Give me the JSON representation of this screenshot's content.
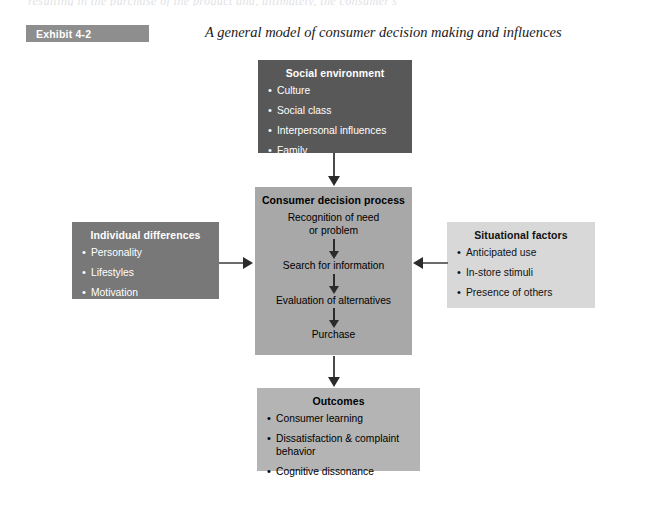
{
  "page": {
    "bleed_text": "resulting in the purchase of the product and, ultimately, the consumer's",
    "exhibit_label": "Exhibit 4-2",
    "exhibit_title": "A general model of consumer decision making and influences"
  },
  "colors": {
    "social_environment_bg": "#585858",
    "individual_differences_bg": "#787878",
    "situational_factors_bg": "#d8d8d8",
    "consumer_decision_process_bg": "#a8a8a8",
    "outcomes_bg": "#b4b4b4",
    "exhibit_tag_bg": "#8e8e8e",
    "arrow": "#2b2b2b"
  },
  "diagram": {
    "social_environment": {
      "title": "Social environment",
      "items": [
        "Culture",
        "Social class",
        "Interpersonal influences",
        "Family"
      ]
    },
    "individual_differences": {
      "title": "Individual differences",
      "items": [
        "Personality",
        "Lifestyles",
        "Motivation"
      ]
    },
    "situational_factors": {
      "title": "Situational factors",
      "items": [
        "Anticipated use",
        "In-store stimuli",
        "Presence of others"
      ]
    },
    "consumer_decision_process": {
      "title": "Consumer decision process",
      "steps": [
        "Recognition of need or problem",
        "Search for information",
        "Evaluation of alternatives",
        "Purchase"
      ],
      "step_lines": [
        [
          "Recognition of need",
          "or problem"
        ],
        [
          "Search for information"
        ],
        [
          "Evaluation of alternatives"
        ],
        [
          "Purchase"
        ]
      ]
    },
    "outcomes": {
      "title": "Outcomes",
      "items": [
        "Consumer learning",
        "Dissatisfaction & complaint behavior",
        "Cognitive dissonance"
      ]
    },
    "connectors": [
      {
        "name": "social-environment-to-consumer-decision-process",
        "direction": "down"
      },
      {
        "name": "individual-differences-to-consumer-decision-process",
        "direction": "right"
      },
      {
        "name": "situational-factors-to-consumer-decision-process",
        "direction": "left"
      },
      {
        "name": "consumer-decision-process-to-outcomes",
        "direction": "down"
      }
    ]
  }
}
